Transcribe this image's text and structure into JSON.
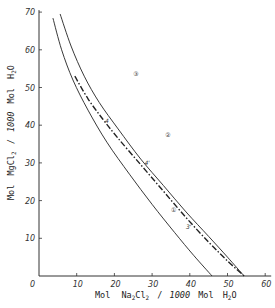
{
  "chart_data": {
    "type": "line",
    "title": "",
    "xlabel": "Mol Na2Cl2 / 1000 Mol H2O",
    "ylabel": "Mol MgCl2 / 1000 Mol H2O",
    "xlim": [
      0,
      60
    ],
    "ylim": [
      0,
      70
    ],
    "x_ticks": [
      0,
      10,
      20,
      30,
      40,
      50,
      60
    ],
    "y_ticks": [
      10,
      20,
      30,
      40,
      50,
      60,
      70
    ],
    "x_tick_labels": [
      "0",
      "10",
      "20",
      "30",
      "40",
      "50",
      "60"
    ],
    "y_tick_labels": [
      "10",
      "20",
      "30",
      "40",
      "50",
      "60",
      "70"
    ],
    "grid": false,
    "legend": null,
    "series": [
      {
        "name": "1",
        "label": "①",
        "style": "solid",
        "points": [
          [
            3.7,
            68.4
          ],
          [
            6,
            60
          ],
          [
            9,
            52
          ],
          [
            13,
            44
          ],
          [
            18,
            35.5
          ],
          [
            24,
            27
          ],
          [
            30,
            19
          ],
          [
            36,
            11.5
          ],
          [
            41,
            5.5
          ],
          [
            45.9,
            0
          ]
        ]
      },
      {
        "name": "2",
        "label": "②",
        "style": "solid",
        "points": [
          [
            5.6,
            69.5
          ],
          [
            8.5,
            61
          ],
          [
            12,
            53
          ],
          [
            16,
            46
          ],
          [
            21,
            39
          ],
          [
            27,
            31
          ],
          [
            33,
            24
          ],
          [
            39,
            17
          ],
          [
            45,
            10.5
          ],
          [
            50,
            5
          ],
          [
            54.4,
            0
          ]
        ]
      },
      {
        "name": "3",
        "label": "③",
        "style": "dash-dot",
        "points": [
          [
            9.5,
            53
          ],
          [
            13,
            47
          ],
          [
            17,
            41.5
          ],
          [
            21,
            36.5
          ],
          [
            27,
            29.5
          ],
          [
            33,
            22.5
          ],
          [
            39,
            15.5
          ],
          [
            45,
            9
          ],
          [
            50,
            4
          ],
          [
            54.4,
            0
          ]
        ]
      }
    ],
    "annotations": [
      {
        "text": "①",
        "x": 35,
        "y": 17
      },
      {
        "text": "②",
        "x": 33.5,
        "y": 37
      },
      {
        "text": "③",
        "x": 25,
        "y": 53
      },
      {
        "text": "4",
        "x": 17.5,
        "y": 40.5
      },
      {
        "text": "4'",
        "x": 28,
        "y": 29.5
      },
      {
        "text": "3'",
        "x": 39,
        "y": 12.5
      }
    ]
  },
  "axes": {
    "x_label_parts": {
      "mol": "Mol",
      "formula": "Na",
      "sub1": "2",
      "cl": "Cl",
      "sub2": "2",
      "per": "/",
      "k": "1000",
      "mol2": "Mol",
      "h": "H",
      "sub3": "2",
      "o": "O"
    },
    "y_label_parts": {
      "mol": "Mol",
      "formula": "Mg",
      "cl": "Cl",
      "sub2": "2",
      "per": "/",
      "k": "1000",
      "mol2": "Mol",
      "h": "H",
      "sub3": "2",
      "o": "O"
    }
  }
}
